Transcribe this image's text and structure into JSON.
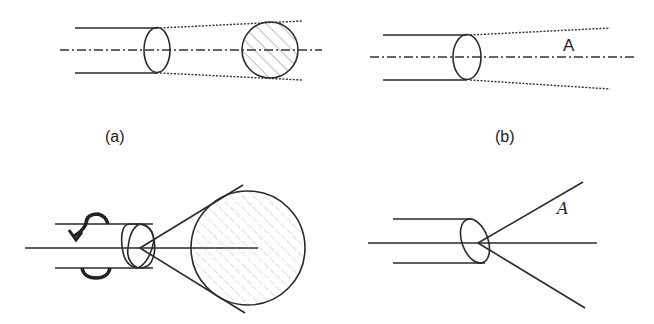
{
  "figure": {
    "panels": [
      {
        "id": "a",
        "label": "(a)",
        "content": "Parallel beam through elliptical aperture, diverging dotted envelope to hatched circular cross-section, dash-dot optical axis"
      },
      {
        "id": "b",
        "label": "(b)",
        "content": "Parallel beam through elliptical aperture, diverging dotted envelope, dash-dot axis",
        "annotation": "A"
      },
      {
        "id": "c",
        "label": "",
        "content": "Rotating beam (curved arrows) with overlapping ellipses, cone from apex tangent to large hatched circle"
      },
      {
        "id": "d",
        "label": "",
        "content": "Beam through tilted ellipse, apex with two diverging lines",
        "annotation": "A"
      }
    ]
  },
  "labels": {
    "a": "(a)",
    "b": "(b)",
    "angle_b": "A",
    "angle_d": "A"
  },
  "colors": {
    "ink": "#2a2a2a",
    "background": "#ffffff"
  }
}
